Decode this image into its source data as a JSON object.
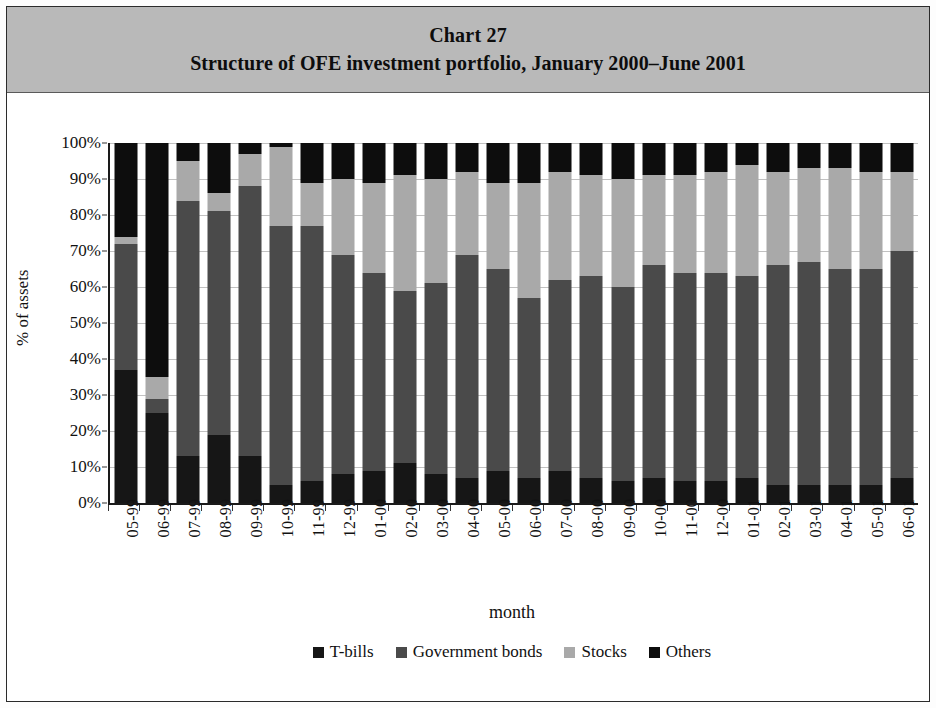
{
  "figure": {
    "chart_number": "Chart 27",
    "title": "Structure of OFE investment portfolio, January 2000–June 2001"
  },
  "legend": {
    "position": "bottom",
    "items": [
      {
        "label": "T-bills",
        "color": "#161616",
        "key": "tbills"
      },
      {
        "label": "Government bonds",
        "color": "#4a4a4a",
        "key": "gov"
      },
      {
        "label": "Stocks",
        "color": "#a9a9a9",
        "key": "stocks"
      },
      {
        "label": "Others",
        "color": "#0d0d0d",
        "key": "others"
      }
    ]
  },
  "axes": {
    "ylabel": "% of assets",
    "xlabel": "month",
    "yticks": [
      "0%",
      "10%",
      "20%",
      "30%",
      "40%",
      "50%",
      "60%",
      "70%",
      "80%",
      "90%",
      "100%"
    ]
  },
  "chart_data": {
    "type": "bar",
    "subtype": "stacked-100-percent",
    "title": "Structure of OFE investment portfolio, January 2000–June 2001",
    "chart_number": "Chart 27",
    "xlabel": "month",
    "ylabel": "% of assets",
    "ylim": [
      0,
      100
    ],
    "ytick_values": [
      0,
      10,
      20,
      30,
      40,
      50,
      60,
      70,
      80,
      90,
      100
    ],
    "ytick_labels": [
      "0%",
      "10%",
      "20%",
      "30%",
      "40%",
      "50%",
      "60%",
      "70%",
      "80%",
      "90%",
      "100%"
    ],
    "grid": true,
    "legend_position": "bottom",
    "units": "percent of assets",
    "categories": [
      "05-99",
      "06-99",
      "07-99",
      "08-99",
      "09-99",
      "10-99",
      "11-99",
      "12-99",
      "01-00",
      "02-00",
      "03-00",
      "04-00",
      "05-00",
      "06-00",
      "07-00",
      "08-00",
      "09-00",
      "10-00",
      "11-00",
      "12-00",
      "01-01",
      "02-01",
      "03-01",
      "04-01",
      "05-01",
      "06-01"
    ],
    "series": [
      {
        "name": "T-bills",
        "color": "#161616",
        "values": [
          37,
          25,
          13,
          19,
          13,
          5,
          6,
          8,
          9,
          11,
          8,
          7,
          9,
          7,
          9,
          7,
          6,
          7,
          6,
          6,
          7,
          5,
          5,
          5,
          5,
          7
        ]
      },
      {
        "name": "Government bonds",
        "color": "#4a4a4a",
        "values": [
          35,
          4,
          71,
          62,
          75,
          72,
          71,
          61,
          55,
          48,
          53,
          62,
          56,
          50,
          53,
          56,
          54,
          59,
          58,
          58,
          56,
          61,
          62,
          60,
          60,
          63
        ]
      },
      {
        "name": "Stocks",
        "color": "#a9a9a9",
        "values": [
          2,
          6,
          11,
          5,
          9,
          22,
          12,
          21,
          25,
          32,
          29,
          23,
          24,
          32,
          30,
          28,
          30,
          25,
          27,
          28,
          31,
          26,
          26,
          28,
          27,
          22
        ]
      },
      {
        "name": "Others",
        "color": "#0d0d0d",
        "values": [
          26,
          65,
          5,
          14,
          3,
          1,
          11,
          10,
          11,
          9,
          10,
          8,
          11,
          11,
          8,
          9,
          10,
          9,
          9,
          8,
          6,
          8,
          7,
          7,
          8,
          8
        ]
      }
    ]
  }
}
